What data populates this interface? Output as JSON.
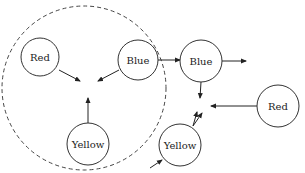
{
  "diagram": {
    "boundary": {
      "cx": 84,
      "cy": 88,
      "r": 82,
      "style": "dashed"
    },
    "nodes": [
      {
        "id": "red-inner",
        "label": "Red",
        "cx": 40,
        "cy": 57,
        "r": 19
      },
      {
        "id": "blue-inner",
        "label": "Blue",
        "cx": 138,
        "cy": 60,
        "r": 20
      },
      {
        "id": "yellow-inner",
        "label": "Yellow",
        "cx": 88,
        "cy": 144,
        "r": 21
      },
      {
        "id": "blue-outer",
        "label": "Blue",
        "cx": 201,
        "cy": 61,
        "r": 21
      },
      {
        "id": "red-outer",
        "label": "Red",
        "cx": 278,
        "cy": 106,
        "r": 21
      },
      {
        "id": "yellow-outer",
        "label": "Yellow",
        "cx": 180,
        "cy": 145,
        "r": 21
      }
    ],
    "edges": [
      {
        "from": "red-inner",
        "x1": 59,
        "y1": 70,
        "x2": 80,
        "y2": 81
      },
      {
        "from": "blue-inner",
        "x1": 119,
        "y1": 70,
        "x2": 98,
        "y2": 81
      },
      {
        "from": "yellow-inner",
        "x1": 88,
        "y1": 123,
        "x2": 88,
        "y2": 98
      },
      {
        "from": "blue-inner",
        "to": "blue-outer",
        "x1": 158,
        "y1": 60,
        "x2": 180,
        "y2": 60
      },
      {
        "from": "blue-outer",
        "x1": 222,
        "y1": 61,
        "x2": 246,
        "y2": 61
      },
      {
        "from": "blue-outer",
        "x1": 201,
        "y1": 82,
        "x2": 200,
        "y2": 98
      },
      {
        "from": "red-outer",
        "x1": 257,
        "y1": 106,
        "x2": 211,
        "y2": 106
      },
      {
        "from": "yellow-outer",
        "x1": 193,
        "y1": 126,
        "x2": 197,
        "y2": 112
      },
      {
        "from": "yellow-outer",
        "x1": 193,
        "y1": 126,
        "x2": 202,
        "y2": 113
      },
      {
        "to": "yellow-outer",
        "x1": 150,
        "y1": 168,
        "x2": 162,
        "y2": 160
      }
    ]
  }
}
